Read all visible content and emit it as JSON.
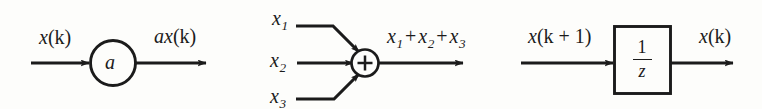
{
  "figure": {
    "type": "signal-flow-block-diagram",
    "background_color": "#fdfdfb",
    "stroke_color": "#1b1b1b",
    "blocks": [
      {
        "id": "gain",
        "kind": "gain-circle",
        "symbol": "a",
        "input_label": "x(k)",
        "output_label": "ax(k)"
      },
      {
        "id": "summer",
        "kind": "summing-junction",
        "symbol": "+",
        "input_labels": [
          "x1",
          "x2",
          "x3"
        ],
        "output_label": "x1 + x2 + x3"
      },
      {
        "id": "delay",
        "kind": "unit-delay-box",
        "numerator": "1",
        "denominator": "z",
        "input_label": "x(k + 1)",
        "output_label": "x(k)"
      }
    ]
  },
  "gain": {
    "symbol": "a",
    "input_label_base": "x",
    "input_label_arg": "(k)",
    "output_label_gain": "a",
    "output_label_base": "x",
    "output_label_arg": "(k)"
  },
  "summer": {
    "symbol": "+",
    "x1_base": "x",
    "x1_sub": "1",
    "x2_base": "x",
    "x2_sub": "2",
    "x3_base": "x",
    "x3_sub": "3",
    "out_x1_base": "x",
    "out_x1_sub": "1",
    "out_plus_1": "+",
    "out_x2_base": "x",
    "out_x2_sub": "2",
    "out_plus_2": "+",
    "out_x3_base": "x",
    "out_x3_sub": "3"
  },
  "delay": {
    "numerator": "1",
    "denominator": "z",
    "in_base": "x",
    "in_arg": "(k + 1)",
    "out_base": "x",
    "out_arg": "(k)"
  }
}
